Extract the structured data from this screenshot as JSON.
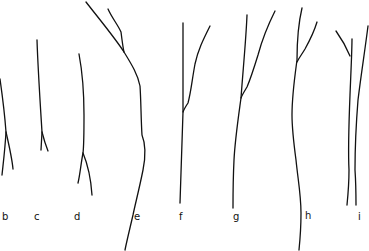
{
  "figure": {
    "type": "line-drawing",
    "stroke_color": "#111111",
    "background": "#ffffff",
    "panels": [
      {
        "label": "b",
        "label_pos": [
          4,
          217
        ],
        "paths": [
          "M0 79 C3 100 5 118 6 132 C5 150 3 165 2 175",
          "M6 132 C9 145 12 158 13 169"
        ]
      },
      {
        "label": "c",
        "label_pos": [
          35,
          217
        ],
        "paths": [
          "M37 40 C38 70 40 100 42 132 L41 150",
          "M42 132 C44 140 46 146 48 151"
        ]
      },
      {
        "label": "d",
        "label_pos": [
          76,
          217
        ],
        "paths": [
          "M79 54 C82 70 84 90 84 115 C84 135 84 145 83 153 C81 163 80 175 78 183",
          "M83 153 C88 165 91 180 92 195"
        ]
      },
      {
        "label": "e",
        "label_pos": [
          134,
          216
        ],
        "paths": [
          "M86 2 C100 20 115 38 124 52 C132 65 138 75 140 86 C141 100 141 120 142 135 C146 145 146 155 143 170 C139 190 135 205 133 215 C130 228 127 240 125 250",
          "M108 9 C112 18 118 25 121 32 C122 40 123 48 124 52"
        ]
      },
      {
        "label": "f",
        "label_pos": [
          180,
          216
        ],
        "paths": [
          "M183 23 C183 60 183 95 183 112 C182 145 181 175 180 203",
          "M210 26 C203 40 198 50 195 64 C192 80 191 92 188 103 C186 106 184 109 183 112"
        ]
      },
      {
        "label": "g",
        "label_pos": [
          235,
          217
        ],
        "paths": [
          "M247 15 C246 40 243 70 241 98 C238 120 235 140 234 160 C233 180 233 195 233 208",
          "M275 11 C268 25 262 40 258 55 C254 68 250 80 247 87 C244 92 242 95 241 98"
        ]
      },
      {
        "label": "h",
        "label_pos": [
          305,
          215
        ],
        "paths": [
          "M302 8 C298 25 297 45 297 60 C295 75 292 95 292 115 C292 130 294 145 296 160 C298 180 301 195 301 213 C301 230 300 240 299 250",
          "M317 22 C314 32 310 40 305 49 C302 54 299 58 297 62"
        ]
      },
      {
        "label": "i",
        "label_pos": [
          359,
          217
        ],
        "paths": [
          "M336 31 C341 38 345 44 350 56",
          "M352 39 C352 50 351 70 350 95 C349 120 348 150 349 170 C349 185 348 195 347 205",
          "M368 26 C365 50 361 75 358 100 C356 125 355 150 355 170 C356 185 356 195 356 205"
        ]
      }
    ]
  },
  "labels": {
    "b": "b",
    "c": "c",
    "d": "d",
    "e": "e",
    "f": "f",
    "g": "g",
    "h": "h",
    "i": "i"
  }
}
